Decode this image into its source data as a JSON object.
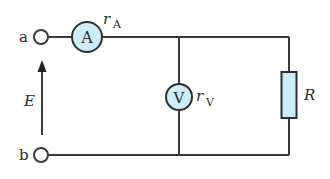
{
  "diagram": {
    "type": "circuit",
    "colors": {
      "wire": "#3a3a3a",
      "meter_fill": "#cdeef6",
      "resistor_fill": "#cdeef6",
      "background": "#ffffff"
    },
    "terminals": {
      "a": {
        "label": "a"
      },
      "b": {
        "label": "b"
      }
    },
    "source": {
      "label": "E"
    },
    "ammeter": {
      "symbol": "A",
      "resistance_label": "r",
      "resistance_subscript": "A"
    },
    "voltmeter": {
      "symbol": "V",
      "resistance_label": "r",
      "resistance_subscript": "V"
    },
    "resistor": {
      "label": "R"
    }
  }
}
